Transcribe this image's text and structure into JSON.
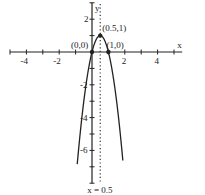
{
  "chart_data": {
    "type": "line",
    "title": "",
    "xlabel": "x",
    "ylabel": "y",
    "xlim": [
      -5,
      5.5
    ],
    "ylim": [
      -8,
      3
    ],
    "grid": false,
    "x_tick_labels": [
      "-4",
      "-2",
      "2",
      "4"
    ],
    "y_tick_labels": [
      "2",
      "-2",
      "-4",
      "-6"
    ],
    "series": [
      {
        "name": "y = -4x^2 + 4x",
        "function": "-4*x*x + 4*x",
        "style": "solid"
      }
    ],
    "asymptote_lines": [
      {
        "label": "x = 0.5",
        "x": 0.5,
        "style": "dotted"
      }
    ],
    "points": [
      {
        "label": "(0,0)",
        "x": 0,
        "y": 0
      },
      {
        "label": "(1,0)",
        "x": 1,
        "y": 0
      },
      {
        "label": "(0.5,1)",
        "x": 0.5,
        "y": 1
      }
    ]
  }
}
